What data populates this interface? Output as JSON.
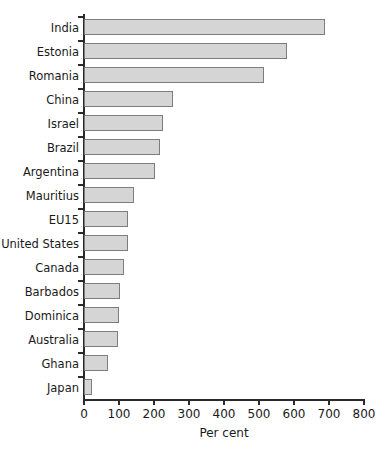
{
  "chart_data": {
    "type": "bar",
    "orientation": "horizontal",
    "title": "",
    "xlabel": "Per cent",
    "ylabel": "",
    "xlim": [
      0,
      800
    ],
    "xticks": [
      0,
      100,
      200,
      300,
      400,
      500,
      600,
      700,
      800
    ],
    "grid": false,
    "legend": null,
    "categories": [
      "India",
      "Estonia",
      "Romania",
      "China",
      "Israel",
      "Brazil",
      "Argentina",
      "Mauritius",
      "EU15",
      "United States",
      "Canada",
      "Barbados",
      "Dominica",
      "Australia",
      "Ghana",
      "Japan"
    ],
    "values": [
      689,
      580,
      514,
      254,
      226,
      217,
      203,
      143,
      126,
      126,
      114,
      103,
      100,
      97,
      69,
      23
    ],
    "bar_fill_color": "#d5d5d5",
    "bar_border_color": "#7d7d7d",
    "axis_color": "#2b2b2b"
  }
}
